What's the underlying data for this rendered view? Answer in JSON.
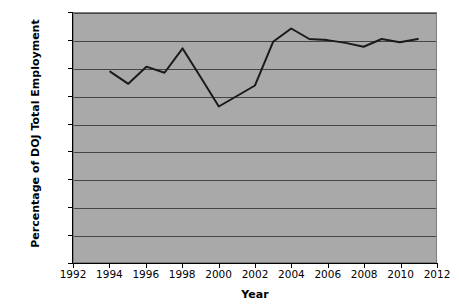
{
  "chart_data": {
    "type": "line",
    "title": "",
    "xlabel": "Year",
    "ylabel": "Percentage of DOJ Total Employment",
    "xlim": [
      1992,
      2012
    ],
    "ylim": [
      0,
      0.45
    ],
    "grid": true,
    "legend": false,
    "x_ticks": [
      1992,
      1994,
      1996,
      1998,
      2000,
      2002,
      2004,
      2006,
      2008,
      2010,
      2012
    ],
    "y_ticks": [
      0,
      0.05,
      0.1,
      0.15,
      0.2,
      0.25,
      0.3,
      0.35,
      0.4,
      0.45
    ],
    "y_tick_labels": [
      "0",
      "0.05",
      "0.1",
      "0.15",
      "0.2",
      "0.25",
      "0.3",
      "0.35",
      "0.4",
      "0.45"
    ],
    "x_tick_labels": [
      "1992",
      "1994",
      "1996",
      "1998",
      "2000",
      "2002",
      "2004",
      "2006",
      "2008",
      "2010",
      "2012"
    ],
    "x": [
      1994,
      1995,
      1996,
      1997,
      1998,
      1999,
      2000,
      2001,
      2002,
      2003,
      2004,
      2005,
      2006,
      2007,
      2008,
      2009,
      2010,
      2011
    ],
    "values": [
      0.344,
      0.322,
      0.353,
      0.342,
      0.386,
      0.334,
      0.281,
      0.3,
      0.319,
      0.398,
      0.422,
      0.403,
      0.401,
      0.396,
      0.389,
      0.403,
      0.397,
      0.403
    ],
    "series": [
      {
        "name": "Percentage of DOJ Total Employment",
        "color": "#1a1a1a",
        "values": [
          0.344,
          0.322,
          0.353,
          0.342,
          0.386,
          0.334,
          0.281,
          0.3,
          0.319,
          0.398,
          0.422,
          0.403,
          0.401,
          0.396,
          0.389,
          0.403,
          0.397,
          0.403
        ]
      }
    ]
  },
  "style": {
    "plot_background": "#a9a9a9",
    "gridline_color": "#454545",
    "axis_color": "#000000",
    "line_color": "#1a1a1a",
    "page_background": "#ffffff"
  }
}
